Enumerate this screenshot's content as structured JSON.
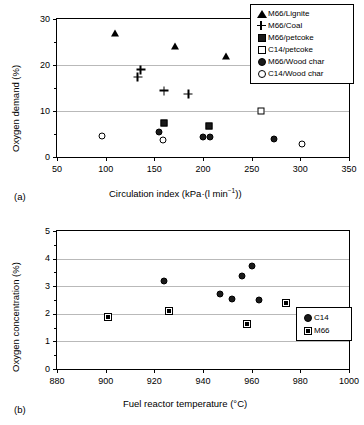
{
  "figure": {
    "panel_a_tag": "(a)",
    "panel_b_tag": "(b)"
  },
  "panel_a": {
    "ylabel": "Oxygen demand (%)",
    "xlabel_prefix": "Circulation index (kPa·(l min",
    "xlabel_sup": "−1",
    "xlabel_suffix": "))",
    "ytick_labels": [
      "0",
      "10",
      "20",
      "30"
    ],
    "xtick_labels": [
      "50",
      "100",
      "150",
      "200",
      "250",
      "300",
      "350"
    ],
    "legend": [
      {
        "label": "M66/Lignite",
        "marker": "triangle-filled"
      },
      {
        "label": "M66/Coal",
        "marker": "plus"
      },
      {
        "label": "M66/petcoke",
        "marker": "square-filled"
      },
      {
        "label": "C14/petcoke",
        "marker": "square-open"
      },
      {
        "label": "M66/Wood char",
        "marker": "circle-filled"
      },
      {
        "label": "C14/Wood char",
        "marker": "circle-open"
      }
    ]
  },
  "panel_b": {
    "ylabel": "Oxygen concentration (%)",
    "xlabel": "Fuel reactor temperature (°C)",
    "ytick_labels": [
      "0",
      "1",
      "2",
      "3",
      "4",
      "5"
    ],
    "xtick_labels": [
      "880",
      "900",
      "920",
      "940",
      "960",
      "980",
      "1000"
    ],
    "legend": [
      {
        "label": "C14",
        "marker": "circle-filled"
      },
      {
        "label": "M66",
        "marker": "square-dotted"
      }
    ]
  },
  "chart_data": [
    {
      "type": "scatter",
      "panel": "(a)",
      "title": "",
      "xlabel": "Circulation index (kPa·(l min^-1))",
      "ylabel": "Oxygen demand (%)",
      "xlim": [
        50,
        350
      ],
      "ylim": [
        0,
        30
      ],
      "xticks": [
        50,
        100,
        150,
        200,
        250,
        300,
        350
      ],
      "yticks": [
        0,
        10,
        20,
        30
      ],
      "minor_yticks": [
        5,
        15,
        25
      ],
      "grid": "horizontal",
      "legend_position": "top-right",
      "series": [
        {
          "name": "M66/Lignite",
          "marker": "triangle-filled",
          "points": [
            [
              110,
              27.0
            ],
            [
              171,
              24.2
            ],
            [
              224,
              22.0
            ]
          ]
        },
        {
          "name": "M66/Coal",
          "marker": "plus",
          "points": [
            [
              133,
              17.4
            ],
            [
              136,
              19.0
            ],
            [
              160,
              14.4
            ],
            [
              185,
              13.7
            ]
          ]
        },
        {
          "name": "M66/petcoke",
          "marker": "square-filled",
          "points": [
            [
              160,
              7.4
            ],
            [
              206,
              6.7
            ]
          ]
        },
        {
          "name": "C14/petcoke",
          "marker": "square-open",
          "points": [
            [
              260,
              10.1
            ]
          ]
        },
        {
          "name": "M66/Wood char",
          "marker": "circle-filled",
          "points": [
            [
              155,
              5.4
            ],
            [
              200,
              4.3
            ],
            [
              207,
              4.3
            ],
            [
              273,
              3.9
            ]
          ]
        },
        {
          "name": "C14/Wood char",
          "marker": "circle-open",
          "points": [
            [
              96,
              4.5
            ],
            [
              159,
              3.6
            ],
            [
              302,
              2.9
            ]
          ]
        }
      ]
    },
    {
      "type": "scatter",
      "panel": "(b)",
      "title": "",
      "xlabel": "Fuel reactor temperature (°C)",
      "ylabel": "Oxygen concentration (%)",
      "xlim": [
        880,
        1000
      ],
      "ylim": [
        0,
        5
      ],
      "xticks": [
        880,
        900,
        920,
        940,
        960,
        980,
        1000
      ],
      "yticks": [
        0,
        1,
        2,
        3,
        4,
        5
      ],
      "minor_yticks": [
        0.5,
        1.5,
        2.5,
        3.5,
        4.5
      ],
      "grid": "horizontal",
      "legend_position": "bottom-right",
      "series": [
        {
          "name": "C14",
          "marker": "circle-filled",
          "points": [
            [
              924,
              3.2
            ],
            [
              947,
              2.7
            ],
            [
              952,
              2.53
            ],
            [
              956,
              3.37
            ],
            [
              960,
              3.75
            ],
            [
              963,
              2.5
            ]
          ]
        },
        {
          "name": "M66",
          "marker": "square-dotted",
          "points": [
            [
              901,
              1.88
            ],
            [
              926,
              2.38
            ],
            [
              958,
              2.2
            ],
            [
              974,
              3.27
            ],
            [
              980,
              2.87
            ]
          ]
        }
      ]
    }
  ]
}
